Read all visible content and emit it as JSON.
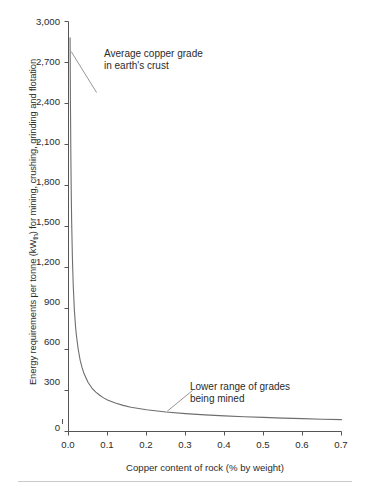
{
  "chart_data": {
    "type": "line",
    "title": "",
    "subtitle": "",
    "xlabel": "Copper content of rock (% by weight)",
    "ylabel_full": "Energy requirements per tonne (kWth) for mining, crushing, grinding and flotation",
    "ylabel_prefix": "Energy requirements per tonne (kW",
    "ylabel_subscript": "th",
    "ylabel_suffix": ") for mining, crushing, grinding and flotation",
    "xlim": [
      0.0,
      0.7
    ],
    "ylim": [
      0,
      3000
    ],
    "xticks": [
      "0.0",
      "0.1",
      "0.2",
      "0.3",
      "0.4",
      "0.5",
      "0.6",
      "0.7"
    ],
    "xtick_values": [
      0.0,
      0.1,
      0.2,
      0.3,
      0.4,
      0.5,
      0.6,
      0.7
    ],
    "yticks": [
      "0",
      "300",
      "600",
      "900",
      "1,200",
      "1,500",
      "1,800",
      "2,100",
      "2,400",
      "2,700",
      "3,000"
    ],
    "ytick_values": [
      0,
      300,
      600,
      900,
      1200,
      1500,
      1800,
      2100,
      2400,
      2700,
      3000
    ],
    "grid": false,
    "legend": "none",
    "line_color": "#6e6e6e",
    "axis_color": "#555555",
    "text_color": "#2b2b2b",
    "series": [
      {
        "name": "Energy vs copper grade",
        "x": [
          0.004,
          0.005,
          0.006,
          0.007,
          0.008,
          0.01,
          0.012,
          0.015,
          0.018,
          0.02,
          0.025,
          0.03,
          0.035,
          0.04,
          0.05,
          0.06,
          0.07,
          0.08,
          0.09,
          0.1,
          0.12,
          0.14,
          0.16,
          0.18,
          0.2,
          0.25,
          0.3,
          0.35,
          0.4,
          0.45,
          0.5,
          0.55,
          0.6,
          0.65,
          0.7
        ],
        "y": [
          2880,
          2400,
          2030,
          1760,
          1550,
          1270,
          1080,
          890,
          770,
          710,
          600,
          520,
          465,
          422,
          360,
          318,
          288,
          265,
          246,
          231,
          208,
          191,
          178,
          168,
          159,
          143,
          131,
          122,
          114,
          108,
          103,
          98,
          94,
          90,
          87
        ]
      }
    ],
    "annotations": [
      {
        "id": "crust",
        "line1": "Average copper grade",
        "line2": "in earth's crust",
        "leader_from": [
          0.007,
          2780
        ],
        "leader_to": [
          0.072,
          2480
        ]
      },
      {
        "id": "grades",
        "line1": "Lower range of grades",
        "line2": "being mined",
        "leader_from": [
          0.253,
          148
        ],
        "leader_to": [
          0.318,
          300
        ]
      }
    ]
  }
}
